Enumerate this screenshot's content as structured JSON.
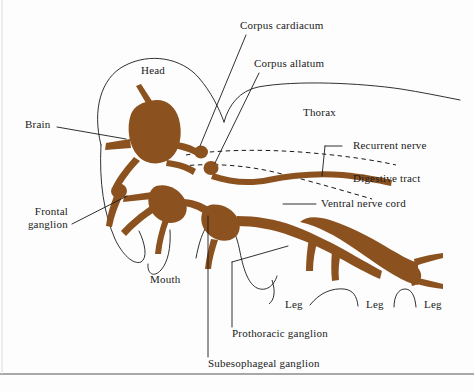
{
  "figure": {
    "type": "anatomical-diagram",
    "background_color": "#fdfdfd",
    "nerve_color": "#8b5220",
    "outline_color": "#1a1a1a",
    "text_color": "#1a1a1a"
  },
  "labels": {
    "head": "Head",
    "brain": "Brain",
    "corpus_cardiacum": "Corpus cardiacum",
    "corpus_allatum": "Corpus allatum",
    "thorax": "Thorax",
    "recurrent_nerve": "Recurrent nerve",
    "digestive_tract": "Digestive tract",
    "ventral_nerve_cord": "Ventral nerve cord",
    "frontal_ganglion_line1": "Frontal",
    "frontal_ganglion_line2": "ganglion",
    "mouth": "Mouth",
    "prothoracic_ganglion": "Prothoracic ganglion",
    "subesophageal_ganglion": "Subesophageal ganglion",
    "leg_1": "Leg",
    "leg_2": "Leg",
    "leg_3": "Leg"
  }
}
